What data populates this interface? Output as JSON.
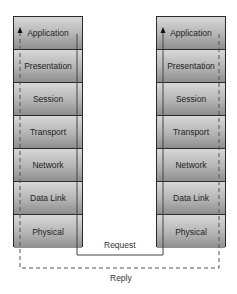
{
  "diagram": {
    "left_stack": {
      "layers": [
        "Application",
        "Presentation",
        "Session",
        "Transport",
        "Network",
        "Data Link",
        "Physical"
      ]
    },
    "right_stack": {
      "layers": [
        "Application",
        "Presentation",
        "Session",
        "Transport",
        "Network",
        "Data Link",
        "Physical"
      ]
    },
    "arrows": {
      "request_label": "Request",
      "reply_label": "Reply"
    },
    "colors": {
      "border": "#2b2b2b",
      "layer_top": "#d8d8d8",
      "layer_bottom": "#8e8e8e",
      "line": "#444444"
    }
  }
}
